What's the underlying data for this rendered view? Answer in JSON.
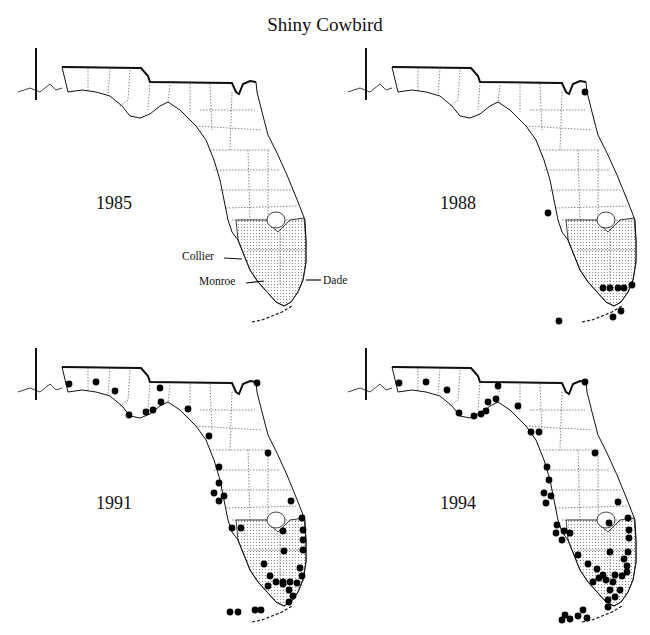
{
  "title": "Shiny Cowbird",
  "colors": {
    "ink": "#111111",
    "stipple": "#8a8a8a",
    "dot": "#000000",
    "background": "#ffffff"
  },
  "panels": [
    {
      "year": "1985",
      "offset": [
        0,
        40
      ],
      "year_pos": [
        96,
        165
      ]
    },
    {
      "year": "1988",
      "offset": [
        330,
        40
      ],
      "year_pos": [
        110,
        165
      ]
    },
    {
      "year": "1991",
      "offset": [
        0,
        340
      ],
      "year_pos": [
        96,
        157
      ]
    },
    {
      "year": "1994",
      "offset": [
        330,
        340
      ],
      "year_pos": [
        110,
        157
      ]
    }
  ],
  "county_labels": [
    {
      "label": "Collier",
      "x": 182,
      "y": 250
    },
    {
      "label": "Monroe",
      "x": 199,
      "y": 275
    },
    {
      "label": "Dade",
      "x": 323,
      "y": 275
    }
  ],
  "chart_data": {
    "type": "map",
    "title": "Shiny Cowbird",
    "shaded_region": [
      "Collier",
      "Monroe",
      "Dade"
    ],
    "maps": [
      {
        "year": 1985,
        "sightings": [
          [
            290,
            310
          ]
        ]
      },
      {
        "year": 1988,
        "sightings": [
          [
            255,
            52
          ],
          [
            218,
            173
          ],
          [
            273,
            248
          ],
          [
            280,
            248
          ],
          [
            288,
            248
          ],
          [
            294,
            248
          ],
          [
            302,
            245
          ],
          [
            291,
            271
          ],
          [
            283,
            277
          ],
          [
            229,
            281
          ]
        ]
      },
      {
        "year": 1991,
        "sightings": [
          [
            69,
            44
          ],
          [
            96,
            42
          ],
          [
            115,
            51
          ],
          [
            160,
            48
          ],
          [
            129,
            75
          ],
          [
            146,
            72
          ],
          [
            153,
            70
          ],
          [
            161,
            62
          ],
          [
            188,
            69
          ],
          [
            209,
            96
          ],
          [
            257,
            43
          ],
          [
            268,
            113
          ],
          [
            219,
            127
          ],
          [
            219,
            143
          ],
          [
            214,
            153
          ],
          [
            224,
            156
          ],
          [
            219,
            161
          ],
          [
            291,
            161
          ],
          [
            302,
            178
          ],
          [
            283,
            191
          ],
          [
            303,
            190
          ],
          [
            303,
            200
          ],
          [
            232,
            188
          ],
          [
            241,
            188
          ],
          [
            284,
            211
          ],
          [
            303,
            210
          ],
          [
            264,
            224
          ],
          [
            300,
            228
          ],
          [
            302,
            236
          ],
          [
            270,
            236
          ],
          [
            276,
            242
          ],
          [
            283,
            242
          ],
          [
            290,
            242
          ],
          [
            297,
            243
          ],
          [
            283,
            244
          ],
          [
            268,
            246
          ],
          [
            289,
            250
          ],
          [
            293,
            256
          ],
          [
            289,
            262
          ],
          [
            255,
            270
          ],
          [
            261,
            270
          ],
          [
            230,
            272
          ],
          [
            238,
            272
          ]
        ]
      },
      {
        "year": 1994,
        "sightings": [
          [
            69,
            43
          ],
          [
            96,
            42
          ],
          [
            117,
            50
          ],
          [
            168,
            46
          ],
          [
            166,
            59
          ],
          [
            158,
            62
          ],
          [
            129,
            73
          ],
          [
            144,
            76
          ],
          [
            151,
            74
          ],
          [
            156,
            71
          ],
          [
            188,
            66
          ],
          [
            201,
            92
          ],
          [
            209,
            92
          ],
          [
            255,
            42
          ],
          [
            265,
            113
          ],
          [
            217,
            127
          ],
          [
            219,
            140
          ],
          [
            214,
            153
          ],
          [
            221,
            156
          ],
          [
            216,
            163
          ],
          [
            288,
            162
          ],
          [
            298,
            178
          ],
          [
            227,
            185
          ],
          [
            234,
            191
          ],
          [
            232,
            200
          ],
          [
            240,
            193
          ],
          [
            226,
            193
          ],
          [
            279,
            183
          ],
          [
            299,
            190
          ],
          [
            299,
            198
          ],
          [
            280,
            212
          ],
          [
            298,
            212
          ],
          [
            294,
            219
          ],
          [
            248,
            215
          ],
          [
            297,
            226
          ],
          [
            258,
            224
          ],
          [
            267,
            229
          ],
          [
            297,
            232
          ],
          [
            273,
            235
          ],
          [
            269,
            238
          ],
          [
            285,
            235
          ],
          [
            292,
            236
          ],
          [
            276,
            240
          ],
          [
            283,
            242
          ],
          [
            263,
            242
          ],
          [
            280,
            250
          ],
          [
            290,
            250
          ],
          [
            285,
            257
          ],
          [
            278,
            260
          ],
          [
            278,
            267
          ],
          [
            253,
            270
          ],
          [
            257,
            278
          ],
          [
            235,
            275
          ],
          [
            240,
            279
          ],
          [
            248,
            276
          ],
          [
            232,
            280
          ]
        ]
      }
    ]
  }
}
